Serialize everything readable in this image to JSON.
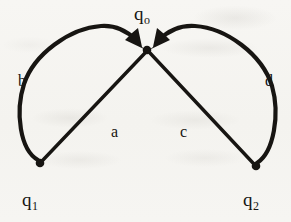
{
  "diagram": {
    "type": "directed-graph",
    "canvas": {
      "width": 291,
      "height": 222
    },
    "ink_color": "#171512",
    "paper_color": "#f6f5f2",
    "nodes": [
      {
        "id": "q0",
        "label": "q",
        "subscript": "o",
        "x": 147,
        "y": 49,
        "role": "target-state"
      },
      {
        "id": "q1",
        "label": "q",
        "subscript": "1",
        "x": 40,
        "y": 163,
        "role": "source-state"
      },
      {
        "id": "q2",
        "label": "q",
        "subscript": "2",
        "x": 256,
        "y": 166,
        "role": "source-state"
      }
    ],
    "edges": [
      {
        "id": "a",
        "label": "a",
        "from": "q1",
        "to": "q0",
        "shape": "straight",
        "arrow": false
      },
      {
        "id": "b",
        "label": "b",
        "from": "q1",
        "to": "q0",
        "shape": "curved-left",
        "arrow": true
      },
      {
        "id": "c",
        "label": "c",
        "from": "q2",
        "to": "q0",
        "shape": "straight",
        "arrow": false
      },
      {
        "id": "d",
        "label": "d",
        "from": "q2",
        "to": "q0",
        "shape": "curved-right",
        "arrow": true
      }
    ]
  }
}
